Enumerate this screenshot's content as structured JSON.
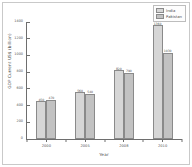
{
  "chart_data": {
    "type": "bar",
    "title": "",
    "xlabel": "Year",
    "ylabel": "GDP Current US$ (billion)",
    "categories": [
      "2000",
      "2005",
      "2008",
      "2010"
    ],
    "series": [
      {
        "name": "India",
        "values": [
          468,
          834,
          1224,
          1684
        ],
        "labels": [
          "468",
          "834",
          "1224",
          "1684"
        ]
      },
      {
        "name": "Pakistan",
        "values": [
          74,
          110,
          170,
          177
        ],
        "labels": [
          "74",
          "110",
          "170",
          "177"
        ]
      }
    ],
    "ylim": [
      0,
      1400
    ],
    "yticks": [
      0,
      200,
      400,
      600,
      800,
      1000,
      1200,
      1400
    ],
    "ytick_labels": [
      "0",
      "200",
      "400",
      "600",
      "800",
      "1000",
      "1200",
      "1400"
    ],
    "bar_heights": {
      "India": [
        450,
        560,
        820,
        1360
      ],
      "Pakistan": [
        470,
        540,
        790,
        1030
      ]
    },
    "bar_value_labels": {
      "India": [
        "450",
        "560",
        "820",
        "1360"
      ],
      "Pakistan": [
        "470",
        "540",
        "790",
        "1030"
      ]
    },
    "grid": false,
    "legend_position": "upper right",
    "colors": {
      "series_0_fill": "#d6d6d6",
      "series_1_fill": "#c2c2c2",
      "bar_edge": "#8a8a8a",
      "axis": "#6e6e6e",
      "text": "#4d4d4d",
      "background": "#ffffff"
    }
  },
  "legend": {
    "entries": [
      {
        "label": "India"
      },
      {
        "label": "Pakistan"
      }
    ]
  }
}
